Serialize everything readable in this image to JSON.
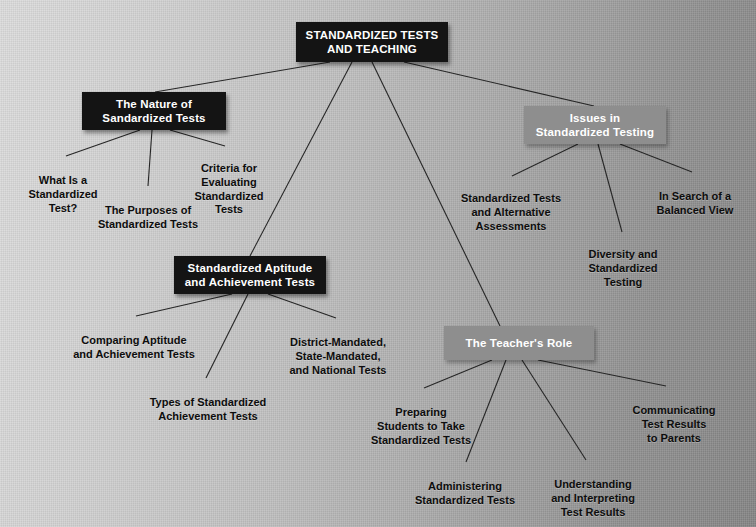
{
  "diagram": {
    "title": "STANDARDIZED TESTS AND TEACHING",
    "type": "concept-map",
    "colors": {
      "primary_node": "#141414",
      "secondary_node": "#8e8e8e",
      "node_text": "#ffffff",
      "leaf_text": "#0d0d0d",
      "edge": "#262626",
      "background_light": "#dcdcdc",
      "background_dark": "#858585"
    },
    "nodes": {
      "root": "STANDARDIZED TESTS\nAND TEACHING",
      "nature": "The Nature of\nSandardized Tests",
      "issues": "Issues in\nStandardized Testing",
      "aptitude": "Standardized Aptitude\nand Achievement Tests",
      "teacher": "The Teacher's Role"
    },
    "leaves": {
      "what_is": "What Is a\nStandardized\nTest?",
      "purposes": "The Purposes of\nStandardized Tests",
      "criteria": "Criteria for\nEvaluating\nStandardized\nTests",
      "alternative": "Standardized Tests\nand Alternative\nAssessments",
      "diversity": "Diversity and\nStandardized\nTesting",
      "balanced": "In Search of a\nBalanced View",
      "comparing": "Comparing Aptitude\nand Achievement Tests",
      "district": "District-Mandated,\nState-Mandated,\nand National Tests",
      "types": "Types of Standardized\nAchievement Tests",
      "preparing": "Preparing\nStudents to Take\nStandardized Tests",
      "administering": "Administering\nStandardized Tests",
      "understanding": "Understanding\nand Interpreting\nTest Results",
      "communicating": "Communicating\nTest Results\nto Parents"
    }
  }
}
